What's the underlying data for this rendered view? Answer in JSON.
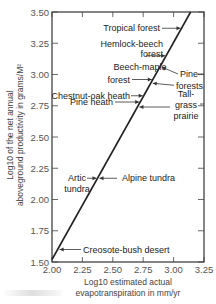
{
  "chart_data": {
    "type": "line",
    "title": "",
    "xlabel_line1": "Log10 estimated actual",
    "xlabel_line2": "evapotranspiration in mm/yr",
    "ylabel_line1": "Log10 of the net annual",
    "ylabel_line2": "aboveground productivity in grams/M²",
    "xlim": [
      2.0,
      3.25
    ],
    "ylim": [
      1.5,
      3.5
    ],
    "x_ticks": [
      2.0,
      2.25,
      2.5,
      2.75,
      3.0,
      3.25
    ],
    "x_tick_labels": [
      "2.00",
      "2.25",
      "2.50",
      "2.75",
      "3.00",
      "3.25"
    ],
    "y_ticks": [
      1.5,
      1.75,
      2.0,
      2.25,
      2.5,
      2.75,
      3.0,
      3.25,
      3.5
    ],
    "y_tick_labels": [
      "1.50",
      "1.75",
      "2.00",
      "2.25",
      "2.50",
      "2.75",
      "3.00",
      "3.25",
      "3.50"
    ],
    "grid": false,
    "series": [
      {
        "name": "regression",
        "x": [
          2.0,
          3.14
        ],
        "y": [
          1.52,
          3.5
        ]
      }
    ],
    "annotations": [
      {
        "lines": [
          "Tropical forest"
        ],
        "side": "left",
        "y": 3.37
      },
      {
        "lines": [
          "Hemlock-beech",
          "forest"
        ],
        "side": "left",
        "y": 3.15
      },
      {
        "lines": [
          "Beech-maple",
          "forest"
        ],
        "side": "left",
        "y": 2.96
      },
      {
        "lines": [
          "Pine",
          "forests"
        ],
        "side": "right",
        "y": 3.06,
        "y2": 2.93
      },
      {
        "lines": [
          "Chestnut-oak heath"
        ],
        "side": "left",
        "y": 2.83
      },
      {
        "lines": [
          "Pine heath"
        ],
        "side": "left",
        "y": 2.78
      },
      {
        "lines": [
          "Tall-",
          "grass",
          "prairie"
        ],
        "side": "right",
        "y": 2.74
      },
      {
        "lines": [
          "Artic",
          "tundra"
        ],
        "side": "left",
        "y": 2.17
      },
      {
        "lines": [
          "Alpine tundra"
        ],
        "side": "right",
        "y": 2.17
      },
      {
        "lines": [
          "Creosote-bush desert"
        ],
        "side": "right",
        "y": 1.6
      }
    ]
  }
}
